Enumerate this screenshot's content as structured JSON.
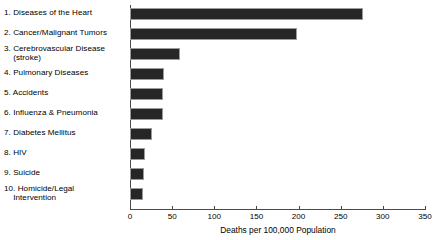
{
  "chart_data": {
    "type": "bar",
    "orientation": "horizontal",
    "title": "",
    "xlabel": "Deaths per 100,000 Population",
    "ylabel": "",
    "xlim": [
      0,
      350
    ],
    "xticks": [
      0,
      50,
      100,
      150,
      200,
      250,
      300,
      350
    ],
    "grid": false,
    "legend": false,
    "categories": [
      "1. Diseases of the Heart",
      "2. Cancer/Malignant Tumors",
      "3. Cerebrovascular Disease\n(stroke)",
      "4. Pulmonary Diseases",
      "5. Accidents",
      "6. Influenza & Pneumonia",
      "7. Diabetes Mellitus",
      "8. HIV",
      "9. Suicide",
      "10. Homicide/Legal\nIntervention"
    ],
    "values": [
      276,
      198,
      59,
      40,
      39,
      39,
      26,
      18,
      17,
      15
    ],
    "bar_color": "#262626",
    "bar_edge_color": "#9b9b9b",
    "axis_color": "#4a4a4a"
  }
}
